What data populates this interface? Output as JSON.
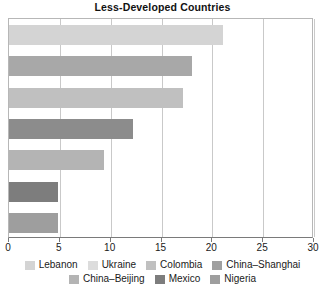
{
  "chart_data": {
    "type": "bar",
    "orientation": "horizontal",
    "title": "Less-Developed Countries",
    "xlabel": "",
    "ylabel": "",
    "xlim": [
      0,
      30
    ],
    "xticks": [
      0,
      5,
      10,
      15,
      20,
      25,
      30
    ],
    "xtick_labels": [
      "0",
      "5",
      "10",
      "15",
      "20",
      "25",
      "30"
    ],
    "grid": true,
    "legend_position": "bottom",
    "categories": [
      "Lebanon",
      "Ukraine",
      "Colombia",
      "China–Shanghai",
      "China–Beijing",
      "Mexico",
      "Nigeria"
    ],
    "values": [
      21.0,
      18.0,
      17.1,
      12.2,
      9.3,
      4.8,
      4.8
    ],
    "colors": [
      "#d4d4d4",
      "#a8a8a8",
      "#c0c0c0",
      "#8c8c8c",
      "#b4b4b4",
      "#7d7d7d",
      "#9e9e9e"
    ],
    "bars": [
      {
        "label": "Lebanon",
        "value": 21.0,
        "color": "#d4d4d4"
      },
      {
        "label": "Ukraine",
        "value": 18.0,
        "color": "#a8a8a8"
      },
      {
        "label": "Colombia",
        "value": 17.1,
        "color": "#c0c0c0"
      },
      {
        "label": "China–Shanghai",
        "value": 12.2,
        "color": "#8c8c8c"
      },
      {
        "label": "China–Beijing",
        "value": 9.3,
        "color": "#b4b4b4"
      },
      {
        "label": "Mexico",
        "value": 4.8,
        "color": "#7d7d7d"
      },
      {
        "label": "Nigeria",
        "value": 4.8,
        "color": "#9e9e9e"
      }
    ]
  },
  "legend": {
    "rows": [
      [
        {
          "label": "Lebanon",
          "color": "#d4d4d4"
        },
        {
          "label": "Ukraine",
          "color": "#dcdcdc"
        },
        {
          "label": "Colombia",
          "color": "#c0c0c0"
        },
        {
          "label": "China–Shanghai",
          "color": "#a0a0a0"
        }
      ],
      [
        {
          "label": "China–Beijing",
          "color": "#b4b4b4"
        },
        {
          "label": "Mexico",
          "color": "#7d7d7d"
        },
        {
          "label": "Nigeria",
          "color": "#9e9e9e"
        }
      ]
    ]
  },
  "style": {
    "axis_color": "#7a7a7a",
    "grid_color": "#c9c9c9",
    "frame_color": "#b7b7b7",
    "text_color": "#1a1a1a",
    "background": "#ffffff"
  }
}
